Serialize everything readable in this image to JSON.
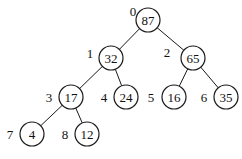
{
  "diagram": {
    "type": "binary-heap-tree",
    "node_radius": 12,
    "nodes": [
      {
        "index": "0",
        "value": "87",
        "cx": 148,
        "cy": 20,
        "lx": 133,
        "ly": 11
      },
      {
        "index": "1",
        "value": "32",
        "cx": 111,
        "cy": 58,
        "lx": 90,
        "ly": 53
      },
      {
        "index": "2",
        "value": "65",
        "cx": 193,
        "cy": 58,
        "lx": 167,
        "ly": 52
      },
      {
        "index": "3",
        "value": "17",
        "cx": 71,
        "cy": 97,
        "lx": 49,
        "ly": 97
      },
      {
        "index": "4",
        "value": "24",
        "cx": 126,
        "cy": 97,
        "lx": 104,
        "ly": 97
      },
      {
        "index": "5",
        "value": "16",
        "cx": 174,
        "cy": 97,
        "lx": 151,
        "ly": 97
      },
      {
        "index": "6",
        "value": "35",
        "cx": 226,
        "cy": 97,
        "lx": 204,
        "ly": 97
      },
      {
        "index": "7",
        "value": "4",
        "cx": 32,
        "cy": 134,
        "lx": 10,
        "ly": 134
      },
      {
        "index": "8",
        "value": "12",
        "cx": 87,
        "cy": 134,
        "lx": 65,
        "ly": 134
      }
    ],
    "edges": [
      [
        0,
        1
      ],
      [
        0,
        2
      ],
      [
        1,
        3
      ],
      [
        1,
        4
      ],
      [
        2,
        5
      ],
      [
        2,
        6
      ],
      [
        3,
        7
      ],
      [
        3,
        8
      ]
    ]
  }
}
